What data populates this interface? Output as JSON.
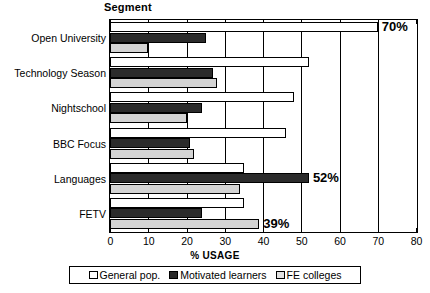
{
  "chart_data": {
    "type": "bar",
    "orientation": "horizontal",
    "title": "Segment",
    "xlabel": "% USAGE",
    "ylabel": "Segment",
    "xlim": [
      0,
      80
    ],
    "xticks": [
      0,
      10,
      20,
      30,
      40,
      50,
      60,
      70,
      80
    ],
    "grid": true,
    "legend_position": "bottom",
    "categories": [
      "Open University",
      "Technology Season",
      "Nightschool",
      "BBC Focus",
      "Languages",
      "FETV"
    ],
    "series": [
      {
        "name": "General pop.",
        "color": "#ffffff",
        "values": [
          70,
          52,
          48,
          46,
          35,
          35
        ]
      },
      {
        "name": "Motivated learners",
        "color": "#2b2b2b",
        "values": [
          25,
          27,
          24,
          21,
          52,
          24
        ]
      },
      {
        "name": "FE colleges",
        "color": "#d4d4d4",
        "values": [
          10,
          28,
          20,
          22,
          34,
          39
        ]
      }
    ],
    "annotations": [
      {
        "text": "70%",
        "category": "Open University",
        "series": "General pop.",
        "value": 70
      },
      {
        "text": "52%",
        "category": "Languages",
        "series": "Motivated learners",
        "value": 52
      },
      {
        "text": "39%",
        "category": "FETV",
        "series": "FE colleges",
        "value": 39
      }
    ]
  },
  "legend": {
    "items": [
      {
        "label": "General pop."
      },
      {
        "label": "Motivated learners"
      },
      {
        "label": "FE colleges"
      }
    ]
  }
}
